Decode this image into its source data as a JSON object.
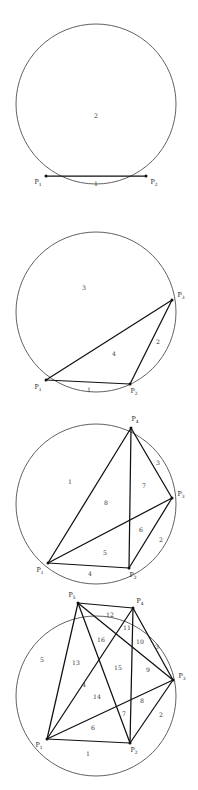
{
  "figure": {
    "panel_count": 4,
    "circle": {
      "cx": 96,
      "cy": 104,
      "r": 80,
      "stroke": "#3a3a3a"
    },
    "chord_color": "#111111"
  },
  "panels": [
    {
      "id": "panel-1",
      "point_count": 2,
      "region_count": 2,
      "points": [
        {
          "label": "P",
          "sub": "1",
          "x": 46,
          "y": 176,
          "lx": 38,
          "ly": 184
        },
        {
          "label": "P",
          "sub": "2",
          "x": 146,
          "y": 176,
          "lx": 154,
          "ly": 184
        }
      ],
      "chords": [
        [
          0,
          1
        ]
      ],
      "regions": [
        {
          "n": "1",
          "x": 96,
          "y": 186
        },
        {
          "n": "2",
          "x": 96,
          "y": 118
        }
      ]
    },
    {
      "id": "panel-2",
      "point_count": 3,
      "region_count": 4,
      "points": [
        {
          "label": "P",
          "sub": "1",
          "x": 46,
          "y": 172,
          "lx": 38,
          "ly": 181
        },
        {
          "label": "P",
          "sub": "2",
          "x": 130,
          "y": 176,
          "lx": 134,
          "ly": 185
        },
        {
          "label": "P",
          "sub": "3",
          "x": 172,
          "y": 92,
          "lx": 181,
          "ly": 89
        }
      ],
      "chords": [
        [
          0,
          1
        ],
        [
          1,
          2
        ],
        [
          0,
          2
        ]
      ],
      "regions": [
        {
          "n": "1",
          "x": 89,
          "y": 184
        },
        {
          "n": "2",
          "x": 158,
          "y": 136
        },
        {
          "n": "3",
          "x": 84,
          "y": 82
        },
        {
          "n": "4",
          "x": 114,
          "y": 148
        }
      ]
    },
    {
      "id": "panel-3",
      "point_count": 4,
      "region_count": 8,
      "points": [
        {
          "label": "P",
          "sub": "1",
          "x": 48,
          "y": 163,
          "lx": 40,
          "ly": 172
        },
        {
          "label": "P",
          "sub": "2",
          "x": 129,
          "y": 168,
          "lx": 133,
          "ly": 177
        },
        {
          "label": "P",
          "sub": "3",
          "x": 172,
          "y": 98,
          "lx": 181,
          "ly": 96
        },
        {
          "label": "P",
          "sub": "4",
          "x": 131,
          "y": 28,
          "lx": 135,
          "ly": 21
        }
      ],
      "chords": [
        [
          0,
          1
        ],
        [
          1,
          2
        ],
        [
          2,
          3
        ],
        [
          0,
          3
        ],
        [
          0,
          2
        ],
        [
          1,
          3
        ]
      ],
      "regions": [
        {
          "n": "1",
          "x": 70,
          "y": 84
        },
        {
          "n": "2",
          "x": 161,
          "y": 142
        },
        {
          "n": "3",
          "x": 158,
          "y": 65
        },
        {
          "n": "5",
          "x": 105,
          "y": 155
        },
        {
          "n": "6",
          "x": 141,
          "y": 132
        },
        {
          "n": "7",
          "x": 144,
          "y": 88
        },
        {
          "n": "8",
          "x": 106,
          "y": 105
        },
        {
          "n": "4",
          "x": 90,
          "y": 176
        }
      ],
      "region_labels_visible": [
        "1",
        "2",
        "3",
        "5",
        "6",
        "7",
        "8",
        "1"
      ]
    },
    {
      "id": "panel-4",
      "point_count": 5,
      "region_count": 16,
      "points": [
        {
          "label": "P",
          "sub": "1",
          "x": 47,
          "y": 147,
          "lx": 39,
          "ly": 155
        },
        {
          "label": "P",
          "sub": "2",
          "x": 130,
          "y": 151,
          "lx": 134,
          "ly": 160
        },
        {
          "label": "P",
          "sub": "3",
          "x": 173,
          "y": 88,
          "lx": 182,
          "ly": 86
        },
        {
          "label": "P",
          "sub": "4",
          "x": 133,
          "y": 16,
          "lx": 140,
          "ly": 11
        },
        {
          "label": "P",
          "sub": "5",
          "x": 78,
          "y": 11,
          "lx": 72,
          "ly": 5
        }
      ],
      "chords": [
        [
          0,
          1
        ],
        [
          1,
          2
        ],
        [
          2,
          3
        ],
        [
          3,
          4
        ],
        [
          0,
          4
        ],
        [
          0,
          2
        ],
        [
          0,
          3
        ],
        [
          1,
          3
        ],
        [
          1,
          4
        ],
        [
          2,
          4
        ]
      ],
      "regions": [
        {
          "n": "1",
          "x": 88,
          "y": 164
        },
        {
          "n": "2",
          "x": 161,
          "y": 125
        },
        {
          "n": "3",
          "x": 157,
          "y": 57
        },
        {
          "n": "5",
          "x": 42,
          "y": 70
        },
        {
          "n": "6",
          "x": 93,
          "y": 138
        },
        {
          "n": "7",
          "x": 124,
          "y": 124
        },
        {
          "n": "8",
          "x": 142,
          "y": 111
        },
        {
          "n": "9",
          "x": 148,
          "y": 80
        },
        {
          "n": "10",
          "x": 140,
          "y": 52
        },
        {
          "n": "11",
          "x": 127,
          "y": 38
        },
        {
          "n": "12",
          "x": 110,
          "y": 25
        },
        {
          "n": "13",
          "x": 76,
          "y": 73
        },
        {
          "n": "14",
          "x": 97,
          "y": 107
        },
        {
          "n": "15",
          "x": 118,
          "y": 78
        },
        {
          "n": "16",
          "x": 101,
          "y": 50
        },
        {
          "n": "4",
          "x": 84,
          "y": 95
        }
      ]
    }
  ]
}
